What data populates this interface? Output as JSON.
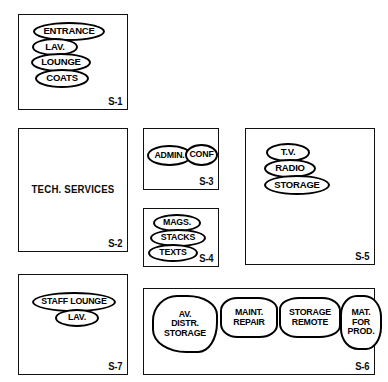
{
  "diagram": {
    "ink_color": "#000000",
    "paper_color": "#ffffff",
    "zones": [
      {
        "code": "S-1",
        "title": "",
        "bubbles": [
          {
            "label": "ENTRANCE",
            "shape": "ellipse"
          },
          {
            "label": "LAV.",
            "shape": "ellipse"
          },
          {
            "label": "LOUNGE",
            "shape": "ellipse"
          },
          {
            "label": "COATS",
            "shape": "ellipse"
          }
        ]
      },
      {
        "code": "S-2",
        "title": "TECH. SERVICES",
        "bubbles": []
      },
      {
        "code": "S-3",
        "title": "",
        "bubbles": [
          {
            "label": "ADMIN.",
            "shape": "ellipse"
          },
          {
            "label": "CONF",
            "shape": "ellipse"
          }
        ]
      },
      {
        "code": "S-4",
        "title": "",
        "bubbles": [
          {
            "label": "MAGS.",
            "shape": "ellipse"
          },
          {
            "label": "STACKS",
            "shape": "ellipse"
          },
          {
            "label": "TEXTS",
            "shape": "ellipse"
          }
        ]
      },
      {
        "code": "S-5",
        "title": "",
        "bubbles": [
          {
            "label": "T.V.",
            "shape": "ellipse"
          },
          {
            "label": "RADIO",
            "shape": "ellipse"
          },
          {
            "label": "STORAGE",
            "shape": "ellipse"
          }
        ]
      },
      {
        "code": "S-6",
        "title": "",
        "bubbles": [
          {
            "label": "AV.\nDISTR.\nSTORAGE",
            "shape": "blob"
          },
          {
            "label": "MAINT.\nREPAIR",
            "shape": "blob"
          },
          {
            "label": "STORAGE\nREMOTE",
            "shape": "blob"
          },
          {
            "label": "MAT.\nFOR\nPROD.",
            "shape": "blob"
          }
        ]
      },
      {
        "code": "S-7",
        "title": "",
        "bubbles": [
          {
            "label": "STAFF LOUNGE",
            "shape": "ellipse"
          },
          {
            "label": "LAV.",
            "shape": "ellipse"
          }
        ]
      }
    ]
  }
}
